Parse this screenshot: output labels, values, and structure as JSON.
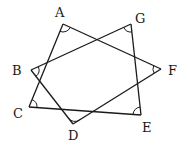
{
  "figure": {
    "type": "seven-pointed star (heptagram) with marked vertex angles",
    "vertices": [
      {
        "label": "A",
        "x": 63,
        "y": 24,
        "label_x": 55,
        "label_y": 17
      },
      {
        "label": "G",
        "x": 131,
        "y": 24,
        "label_x": 135,
        "label_y": 23
      },
      {
        "label": "F",
        "x": 161,
        "y": 69,
        "label_x": 168,
        "label_y": 75
      },
      {
        "label": "E",
        "x": 141,
        "y": 115,
        "label_x": 142,
        "label_y": 132
      },
      {
        "label": "D",
        "x": 73,
        "y": 124,
        "label_x": 68,
        "label_y": 140
      },
      {
        "label": "C",
        "x": 29,
        "y": 107,
        "label_x": 13,
        "label_y": 118
      },
      {
        "label": "B",
        "x": 31,
        "y": 70,
        "label_x": 12,
        "label_y": 75
      }
    ],
    "edges": [
      [
        "A",
        "F"
      ],
      [
        "F",
        "D"
      ],
      [
        "D",
        "B"
      ],
      [
        "B",
        "G"
      ],
      [
        "G",
        "E"
      ],
      [
        "E",
        "C"
      ],
      [
        "C",
        "A"
      ]
    ],
    "angle_marks": [
      "A",
      "B",
      "C",
      "D",
      "E",
      "F",
      "G"
    ],
    "line_color": "#1a1a1a",
    "background": "#ffffff"
  }
}
